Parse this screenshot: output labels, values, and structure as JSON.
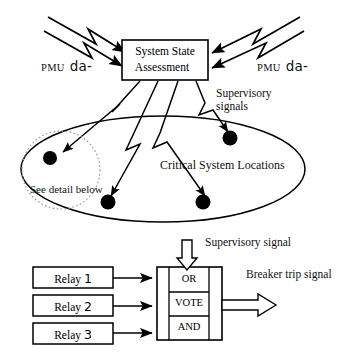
{
  "diagram": {
    "title_blocks": {
      "system_state_assessment": {
        "line1": "System   State",
        "line2": "Assessment"
      }
    },
    "labels": {
      "pmu_data_left_small": "PMU",
      "pmu_data_left_big": "da-",
      "pmu_data_right_small": "PMU",
      "pmu_data_right_big": "da-",
      "supervisory_signals_line1": "Supervisory",
      "supervisory_signals_line2": "signals",
      "critical_system_locations": "Critical System Locations",
      "see_detail_below": "See detail below",
      "supervisory_signal_bottom": "Supervisory signal",
      "breaker_trip_signal": "Breaker trip signal"
    },
    "relays": [
      {
        "name": "Relay",
        "number": "1"
      },
      {
        "name": "Relay",
        "number": "2"
      },
      {
        "name": "Relay",
        "number": "3"
      }
    ],
    "logic_gates": [
      {
        "label": "OR"
      },
      {
        "label": "VOTE"
      },
      {
        "label": "AND"
      }
    ],
    "colors": {
      "stroke": "#000000",
      "background": "#ffffff",
      "node_fill": "#000000",
      "dotted_circle": "#999999"
    },
    "node_count": 4
  }
}
